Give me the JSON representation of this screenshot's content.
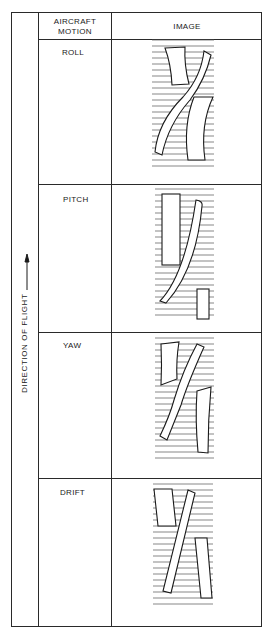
{
  "header": {
    "col_motion": "AIRCRAFT MOTION",
    "col_motion_line1": "AIRCRAFT",
    "col_motion_line2": "MOTION",
    "col_image": "IMAGE"
  },
  "side_label": "DIRECTION OF FLIGHT",
  "side_arrow": "arrow-up-icon",
  "rows": [
    {
      "motion": "ROLL",
      "image": "roll-distortion-diagram"
    },
    {
      "motion": "PITCH",
      "image": "pitch-distortion-diagram"
    },
    {
      "motion": "YAW",
      "image": "yaw-distortion-diagram"
    },
    {
      "motion": "DRIFT",
      "image": "drift-distortion-diagram"
    }
  ],
  "colors": {
    "ink": "#1a1a1a",
    "scanline": "#555555"
  }
}
